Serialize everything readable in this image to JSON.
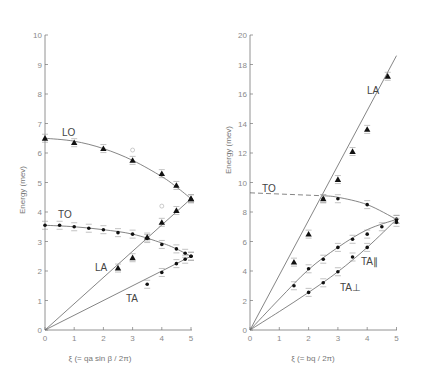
{
  "chart_data": [
    {
      "type": "scatter",
      "title": "",
      "xlabel": "ξ (= qa sin β / 2π)",
      "ylabel": "Energy (mev)",
      "xlim": [
        0,
        5
      ],
      "ylim": [
        0,
        10
      ],
      "xticks": [
        "0",
        "1",
        "2",
        "3",
        "4",
        "5"
      ],
      "yticks": [
        "0",
        "1",
        "2",
        "3",
        "4",
        "5",
        "6",
        "7",
        "8",
        "9",
        "10"
      ],
      "grid": false,
      "series": [
        {
          "name": "LO",
          "marker": "triangle",
          "x": [
            0,
            1,
            2,
            3,
            4,
            4.5,
            5
          ],
          "y": [
            6.5,
            6.35,
            6.15,
            5.75,
            5.3,
            4.9,
            4.45
          ]
        },
        {
          "name": "TO",
          "marker": "dot",
          "x": [
            0,
            0.5,
            1,
            1.5,
            2,
            2.5,
            3,
            3.5,
            4,
            4.5,
            4.8,
            5
          ],
          "y": [
            3.55,
            3.55,
            3.5,
            3.45,
            3.4,
            3.3,
            3.25,
            3.1,
            2.9,
            2.75,
            2.6,
            2.5
          ]
        },
        {
          "name": "LA",
          "marker": "triangle",
          "x": [
            2.5,
            3,
            3.5,
            4,
            4.5,
            5
          ],
          "y": [
            2.1,
            2.45,
            3.15,
            3.65,
            4.05,
            4.45
          ]
        },
        {
          "name": "TA",
          "marker": "dot",
          "x": [
            3.5,
            4,
            4.5,
            4.8,
            5
          ],
          "y": [
            1.55,
            1.95,
            2.25,
            2.4,
            2.5
          ]
        }
      ],
      "curves": {
        "LO": [
          [
            0,
            6.5
          ],
          [
            1,
            6.4
          ],
          [
            2,
            6.15
          ],
          [
            3,
            5.75
          ],
          [
            4,
            5.2
          ],
          [
            4.5,
            4.85
          ],
          [
            5,
            4.45
          ]
        ],
        "TO": [
          [
            0,
            3.55
          ],
          [
            1,
            3.5
          ],
          [
            2,
            3.4
          ],
          [
            3,
            3.25
          ],
          [
            4,
            2.95
          ],
          [
            4.5,
            2.75
          ],
          [
            5,
            2.5
          ]
        ],
        "LA": [
          [
            0,
            0
          ],
          [
            5,
            4.45
          ]
        ],
        "TA": [
          [
            0,
            0
          ],
          [
            5,
            2.5
          ]
        ]
      },
      "labels": [
        {
          "text": "LO",
          "x": 0.6,
          "y": 6.6
        },
        {
          "text": "TO",
          "x": 0.5,
          "y": 3.9
        },
        {
          "text": "LA",
          "x": 1.7,
          "y": 2.05
        },
        {
          "text": "TA",
          "x": 2.75,
          "y": 1.1
        }
      ]
    },
    {
      "type": "scatter",
      "title": "",
      "xlabel": "ξ (= bq / 2π)",
      "ylabel": "Energy (mev)",
      "xlim": [
        0,
        5
      ],
      "ylim": [
        0,
        20
      ],
      "xticks": [
        "0",
        "1",
        "2",
        "3",
        "4",
        "5"
      ],
      "yticks": [
        "0",
        "2",
        "4",
        "6",
        "8",
        "10",
        "12",
        "14",
        "16",
        "18",
        "20"
      ],
      "grid": false,
      "series": [
        {
          "name": "LA",
          "marker": "triangle",
          "x": [
            1.5,
            2,
            2.5,
            3,
            3.5,
            4,
            4.7
          ],
          "y": [
            4.6,
            6.5,
            8.9,
            10.2,
            12.1,
            13.6,
            17.2
          ]
        },
        {
          "name": "TO",
          "marker": "dot",
          "x": [
            2.5,
            3,
            4,
            5
          ],
          "y": [
            8.9,
            8.9,
            8.5,
            7.5
          ]
        },
        {
          "name": "TA∥",
          "marker": "dot",
          "x": [
            1.5,
            2,
            2.5,
            3,
            3.5,
            4,
            4.5,
            5
          ],
          "y": [
            3.0,
            4.15,
            4.8,
            5.6,
            6.15,
            6.5,
            7.0,
            7.5
          ]
        },
        {
          "name": "TA⊥",
          "marker": "dot",
          "x": [
            2,
            2.5,
            3,
            3.5,
            4,
            5
          ],
          "y": [
            2.55,
            3.2,
            3.95,
            4.95,
            5.6,
            7.3
          ]
        }
      ],
      "curves": {
        "LA": [
          [
            0,
            0
          ],
          [
            5,
            18.6
          ]
        ],
        "TO_dashed": [
          [
            0,
            9.3
          ],
          [
            2.5,
            9.1
          ]
        ],
        "TO": [
          [
            2.5,
            9.1
          ],
          [
            3,
            9.0
          ],
          [
            4,
            8.5
          ],
          [
            5,
            7.5
          ]
        ],
        "TA∥": [
          [
            0,
            0
          ],
          [
            1,
            2.1
          ],
          [
            2,
            4.1
          ],
          [
            3,
            5.6
          ],
          [
            4,
            6.8
          ],
          [
            5,
            7.5
          ]
        ],
        "TA⊥": [
          [
            0,
            0
          ],
          [
            1,
            1.25
          ],
          [
            2,
            2.55
          ],
          [
            3,
            3.95
          ],
          [
            4,
            5.6
          ],
          [
            5,
            7.5
          ]
        ]
      },
      "labels": [
        {
          "text": "LA",
          "x": 3.85,
          "y": 15.7
        },
        {
          "text": "TO",
          "x": 0.4,
          "y": 9.8
        },
        {
          "text": "TA∥",
          "x": 3.4,
          "y": 5.4
        },
        {
          "text": "TA⊥",
          "x": 2.85,
          "y": 3.3
        }
      ]
    }
  ],
  "left": {
    "ylabel": "Energy (mev)",
    "xlabel": "ξ (= qa sin β / 2π)",
    "labels": {
      "LO": "LO",
      "TO": "TO",
      "LA": "LA",
      "TA": "TA"
    }
  },
  "right": {
    "ylabel": "Energy (mev)",
    "xlabel": "ξ (= bq / 2π)",
    "labels": {
      "LA": "LA",
      "TO": "TO",
      "TApar": "TA∥",
      "TAperp": "TA⊥"
    }
  }
}
